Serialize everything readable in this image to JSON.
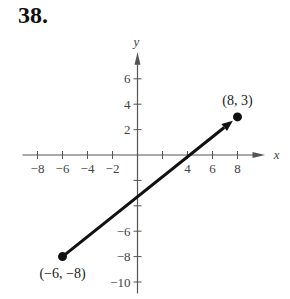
{
  "problem": {
    "number": "38."
  },
  "chart_data": {
    "type": "line",
    "title": "",
    "xlabel": "x",
    "ylabel": "y",
    "xlim": [
      -9,
      9
    ],
    "ylim": [
      -11,
      7.5
    ],
    "x_ticks": [
      -8,
      -6,
      -4,
      -2,
      2,
      4,
      6,
      8
    ],
    "x_tick_labels": [
      "−8",
      "−6",
      "−4",
      "−2",
      "",
      "4",
      "6",
      "8"
    ],
    "y_ticks": [
      6,
      4,
      2,
      -2,
      -4,
      -6,
      -8,
      -10
    ],
    "y_tick_labels": [
      "6",
      "4",
      "2",
      "",
      "",
      "−6",
      "−8",
      "−10"
    ],
    "grid": false,
    "series": [
      {
        "name": "directed segment",
        "x": [
          -6,
          8
        ],
        "y": [
          -8,
          3
        ],
        "arrow_at_end": true
      }
    ],
    "points": [
      {
        "x": 8,
        "y": 3,
        "label": "(8, 3)"
      },
      {
        "x": -6,
        "y": -8,
        "label": "(−6, −8)"
      }
    ]
  }
}
